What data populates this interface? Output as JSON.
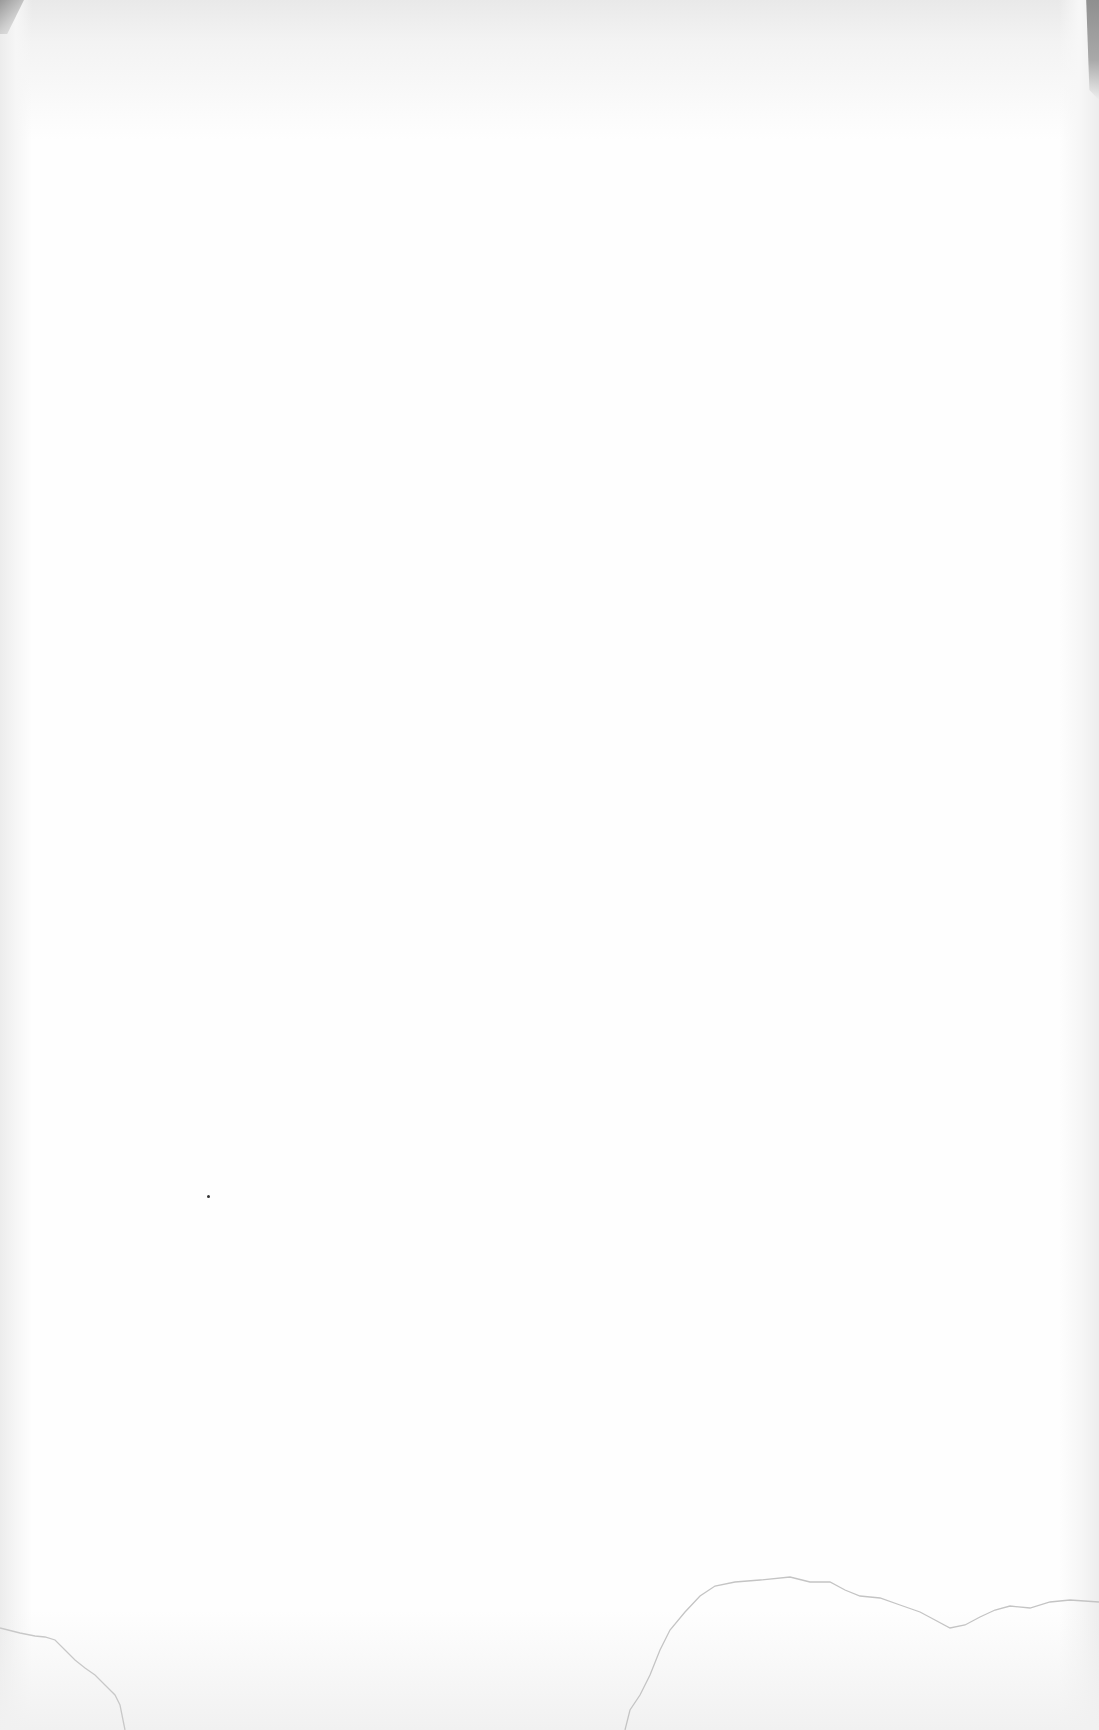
{
  "document": {
    "type": "scanned-page",
    "content": "",
    "background_color": "#fefefe",
    "bleed_through_text": "",
    "marks": {
      "speck": {
        "x": 208,
        "y": 1196
      },
      "creases": [
        "M0,1628 L20,1633 L35,1636 L45,1637 L55,1640 L65,1650 L75,1660 L85,1668 L95,1675 L105,1685 L115,1695 L120,1705 L125,1730",
        "M625,1730 L630,1710 L640,1695 L650,1675 L660,1650 L670,1630 L685,1612 L700,1596 L715,1586 L735,1582 L760,1580 L790,1577 L810,1582 L830,1582 L845,1590 L860,1596 L880,1598 L900,1605 L920,1612 L935,1620 L950,1628 L965,1625 L980,1617 L995,1610 L1010,1606 L1030,1608 L1050,1602 L1070,1600 L1099,1602"
      ]
    }
  }
}
